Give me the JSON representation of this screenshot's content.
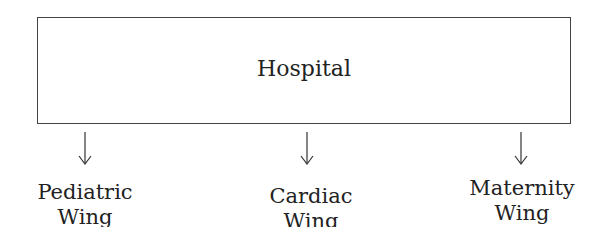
{
  "root": {
    "label": "Hospital"
  },
  "children": [
    {
      "line1": "Pediatric",
      "line2": "Wing"
    },
    {
      "line1": "Cardiac",
      "line2": "Wing"
    },
    {
      "line1": "Maternity",
      "line2": "Wing"
    }
  ]
}
